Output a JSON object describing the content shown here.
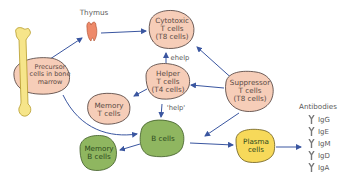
{
  "diagram": {
    "colors": {
      "t_cell_fill": "#f6cdb8",
      "t_cell_stroke": "#4a3a36",
      "b_cell_fill": "#8fb660",
      "b_cell_stroke": "#3e5a26",
      "plasma_fill": "#f7d95a",
      "bone_fill": "#f6e58a",
      "thymus_fill": "#ee8a6a",
      "arrow": "#3a56a0"
    },
    "nodes": {
      "thymus": {
        "label": "Thymus"
      },
      "precursor": {
        "label": "Precursor\ncells in bone\nmarrow"
      },
      "cytotoxic": {
        "label": "Cytotoxic\nT cells\n(T8 cells)"
      },
      "helper": {
        "label": "Helper\nT cells\n(T4 cells)"
      },
      "suppressor": {
        "label": "Suppressor\nT cells\n(T8 cells)"
      },
      "memory_t": {
        "label": "Memory\nT cells"
      },
      "b_cells": {
        "label": "B cells"
      },
      "memory_b": {
        "label": "Memory\nB cells"
      },
      "plasma": {
        "label": "Plasma\ncells"
      }
    },
    "edge_labels": {
      "help_upper": "ehelp",
      "help_lower": "'help'"
    },
    "antibodies": {
      "title": "Antibodies",
      "items": [
        "IgG",
        "IgE",
        "IgM",
        "IgD",
        "IgA"
      ]
    }
  }
}
